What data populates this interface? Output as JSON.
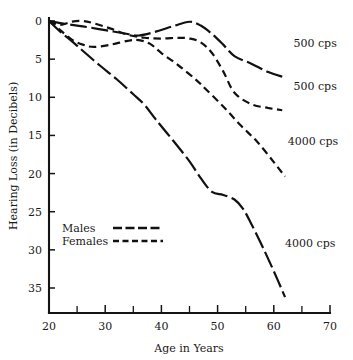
{
  "chart_data": {
    "type": "line",
    "title": "",
    "xlabel": "Age in Years",
    "ylabel": "Hearing Loss (in Decibels)",
    "xlim": [
      20,
      70
    ],
    "ylim": [
      0,
      37
    ],
    "y_inverted": true,
    "grid": false,
    "legend_position": "inside-lower-left",
    "xticks": [
      20,
      30,
      40,
      50,
      60,
      70
    ],
    "xticks_minor": [
      25,
      35,
      45,
      55,
      65
    ],
    "yticks": [
      0,
      5,
      10,
      15,
      20,
      25,
      30,
      35
    ],
    "xtick_labels": [
      "20",
      "30",
      "40",
      "50",
      "60",
      "70"
    ],
    "ytick_labels": [
      "0",
      "5",
      "10",
      "15",
      "20",
      "25",
      "30",
      "35"
    ],
    "legend": [
      {
        "name": "Males",
        "dash": "long-dash"
      },
      {
        "name": "Females",
        "dash": "short-dash"
      }
    ],
    "series": [
      {
        "name": "Males 500 cps",
        "group": "Males",
        "frequency": "500 cps",
        "dash": "long-dash",
        "end_label": "500 cps",
        "x": [
          20,
          23,
          26,
          30,
          34,
          36,
          39,
          42,
          45,
          47,
          49,
          51,
          53,
          56,
          59,
          61.5
        ],
        "y": [
          0,
          0.4,
          0.7,
          1.2,
          1.7,
          1.9,
          1.4,
          0.7,
          0.1,
          0.6,
          1.7,
          3.1,
          4.6,
          5.6,
          6.7,
          7.3
        ]
      },
      {
        "name": "Females 500 cps",
        "group": "Females",
        "frequency": "500 cps",
        "dash": "short-dash",
        "end_label": "500 cps",
        "x": [
          20,
          22,
          24,
          26,
          28,
          31,
          34,
          37,
          40,
          43,
          45,
          47,
          49,
          51,
          53,
          56,
          59,
          61.5
        ],
        "y": [
          0,
          0.5,
          0.1,
          0.0,
          0.3,
          1.0,
          1.8,
          2.2,
          2.3,
          2.2,
          2.3,
          2.8,
          4.2,
          6.6,
          9.4,
          10.9,
          11.4,
          11.7
        ]
      },
      {
        "name": "Females 4000 cps",
        "group": "Females",
        "frequency": "4000 cps",
        "dash": "short-dash",
        "end_label": "4000 cps",
        "x": [
          20,
          22,
          24,
          26,
          28,
          31,
          34,
          36,
          38,
          40,
          43,
          46,
          48,
          51,
          54,
          57,
          60,
          62
        ],
        "y": [
          0,
          1.2,
          2.4,
          3.1,
          3.4,
          3.1,
          2.6,
          2.5,
          3.0,
          4.2,
          5.8,
          7.6,
          9.0,
          11.2,
          13.6,
          15.8,
          18.5,
          20.4
        ]
      },
      {
        "name": "Males 4000 cps",
        "group": "Males",
        "frequency": "4000 cps",
        "dash": "solid-long-dash",
        "end_label": "4000 cps",
        "x": [
          20,
          22,
          24,
          26,
          29,
          32,
          35,
          37,
          39,
          42,
          45,
          47,
          49,
          51,
          53,
          54.5,
          56,
          58,
          60,
          62
        ],
        "y": [
          0,
          1.4,
          2.6,
          3.9,
          5.8,
          7.6,
          9.6,
          11.0,
          12.9,
          15.6,
          18.4,
          20.6,
          22.4,
          22.8,
          23.4,
          24.6,
          26.6,
          29.6,
          32.8,
          36.2
        ]
      }
    ],
    "annotations": [
      {
        "text": "500 cps",
        "x": 63.5,
        "y": 3.4
      },
      {
        "text": "500 cps",
        "x": 63.5,
        "y": 9.0
      },
      {
        "text": "4000 cps",
        "x": 62.5,
        "y": 16.2
      },
      {
        "text": "4000 cps",
        "x": 62.0,
        "y": 29.6
      }
    ]
  }
}
